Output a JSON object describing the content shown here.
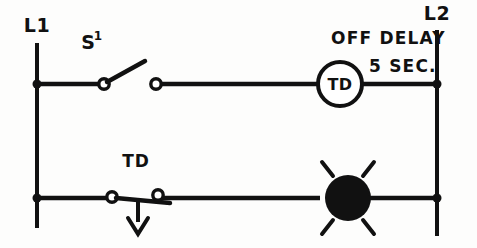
{
  "diagram": {
    "type": "ladder-logic-diagram",
    "rails": {
      "left": {
        "label": "L1",
        "x": 37,
        "top": 43,
        "bottom": 228
      },
      "right": {
        "label": "L2",
        "x": 437,
        "top": 30,
        "bottom": 236
      }
    },
    "rungs": [
      {
        "name": "rung-1-timer-coil",
        "y": 84,
        "components": [
          {
            "name": "switch-s1",
            "label": "S",
            "superscript": "1",
            "kind": "normally-open-switch"
          },
          {
            "name": "timer-coil-td",
            "label": "TD",
            "kind": "coil"
          }
        ],
        "annotation": {
          "line1": "OFF DELAY",
          "line2": "5 SEC."
        }
      },
      {
        "name": "rung-2-lamp",
        "y": 198,
        "components": [
          {
            "name": "contact-td",
            "label": "TD",
            "kind": "timed-contact-off-delay"
          },
          {
            "name": "indicator-lamp",
            "kind": "pilot-lamp"
          }
        ]
      }
    ],
    "colors": {
      "line": "#111111",
      "background": "#fdfdfc",
      "lamp_fill": "#111111",
      "contact_fill": "#ffffff"
    }
  },
  "labels": {
    "l1": "L1",
    "l2": "L2",
    "switch_s": "S",
    "switch_s_sup": "1",
    "coil_td": "TD",
    "contact_td": "TD",
    "off_delay": "OFF DELAY",
    "five_sec": "5 SEC."
  }
}
